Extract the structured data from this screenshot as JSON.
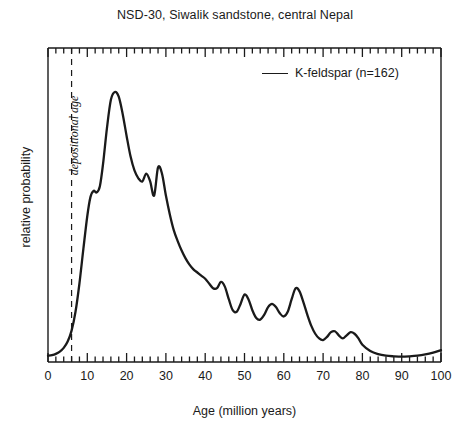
{
  "chart_data": {
    "type": "line",
    "title": "NSD-30, Siwalik sandstone, central Nepal",
    "xlabel": "Age (million years)",
    "ylabel": "relative probability",
    "xlim": [
      0,
      100
    ],
    "ylim": [
      0,
      1.0
    ],
    "grid": false,
    "legend_position": "top-right",
    "xticks": [
      0,
      10,
      20,
      30,
      40,
      50,
      60,
      70,
      80,
      90,
      100
    ],
    "xticklabels": [
      "0",
      "10",
      "20",
      "30",
      "40",
      "50",
      "60",
      "70",
      "80",
      "90",
      "100"
    ],
    "xminor_tick_interval": 2,
    "yticks": [],
    "yticklabels": [],
    "series": [
      {
        "name": "K-feldspar (n=162)",
        "n": 162,
        "color": "#1a1a1a",
        "x": [
          0,
          1,
          2,
          3,
          4,
          5,
          6,
          7,
          8,
          9,
          10,
          10.8,
          11.6,
          12.4,
          13.2,
          14,
          15,
          16,
          17,
          18,
          19,
          20,
          21,
          22,
          23,
          24,
          25,
          26,
          27,
          28,
          29,
          30,
          31,
          32,
          33,
          34,
          35,
          36,
          37,
          38,
          39,
          40,
          41,
          42,
          43,
          44,
          45,
          46,
          47,
          48,
          49,
          50,
          51,
          52,
          53,
          54,
          55,
          56,
          57,
          58,
          59,
          60,
          61,
          62,
          63,
          64,
          65,
          66,
          67,
          68,
          69,
          70,
          71,
          72,
          73,
          74,
          75,
          76,
          77,
          78,
          79,
          80,
          82,
          84,
          86,
          88,
          90,
          92,
          94,
          96,
          98,
          100
        ],
        "y": [
          0.02,
          0.022,
          0.026,
          0.033,
          0.045,
          0.065,
          0.1,
          0.16,
          0.25,
          0.36,
          0.465,
          0.525,
          0.545,
          0.54,
          0.56,
          0.63,
          0.745,
          0.835,
          0.86,
          0.845,
          0.79,
          0.72,
          0.655,
          0.61,
          0.585,
          0.575,
          0.6,
          0.575,
          0.53,
          0.62,
          0.6,
          0.53,
          0.47,
          0.42,
          0.385,
          0.355,
          0.33,
          0.31,
          0.295,
          0.285,
          0.275,
          0.265,
          0.25,
          0.235,
          0.235,
          0.255,
          0.24,
          0.2,
          0.165,
          0.16,
          0.185,
          0.215,
          0.2,
          0.165,
          0.14,
          0.135,
          0.15,
          0.175,
          0.185,
          0.175,
          0.155,
          0.145,
          0.16,
          0.2,
          0.235,
          0.225,
          0.19,
          0.15,
          0.115,
          0.09,
          0.075,
          0.07,
          0.08,
          0.095,
          0.098,
          0.085,
          0.075,
          0.085,
          0.095,
          0.09,
          0.075,
          0.055,
          0.035,
          0.025,
          0.02,
          0.018,
          0.017,
          0.018,
          0.02,
          0.024,
          0.03,
          0.038
        ]
      }
    ],
    "annotations": [
      {
        "text": "depositional age",
        "type": "vertical-dashed-line",
        "x": 6,
        "style": "italic"
      }
    ]
  },
  "legend": {
    "entries": [
      {
        "label": "K-feldspar (n=162)"
      }
    ]
  },
  "icons": {
    "legend_line": "line-swatch-icon"
  }
}
